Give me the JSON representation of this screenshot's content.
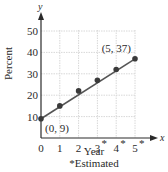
{
  "chart_data": {
    "type": "scatter",
    "title": "",
    "xlabel": "Year",
    "ylabel": "Percent",
    "x_axis_var": "x",
    "y_axis_var": "y",
    "footnote": "*Estimated",
    "x_ticks": [
      "0",
      "1",
      "2",
      "3*",
      "4*",
      "5*"
    ],
    "y_ticks": [
      "10",
      "20",
      "30",
      "40",
      "50"
    ],
    "xlim": [
      0,
      5
    ],
    "ylim": [
      0,
      50
    ],
    "grid": true,
    "points": [
      {
        "x": 0,
        "y": 9
      },
      {
        "x": 1,
        "y": 15
      },
      {
        "x": 2,
        "y": 22
      },
      {
        "x": 3,
        "y": 27
      },
      {
        "x": 4,
        "y": 32
      },
      {
        "x": 5,
        "y": 37
      }
    ],
    "trend_line": {
      "from": [
        0,
        9
      ],
      "to": [
        5,
        37
      ]
    },
    "annotations": [
      {
        "text": "(0, 9)",
        "x": 0,
        "y": 9
      },
      {
        "text": "(5, 37)",
        "x": 5,
        "y": 37
      }
    ],
    "colors": {
      "point": "#3a3a3a",
      "line": "#555555",
      "grid": "#d8d8d8",
      "axis": "#2a2a2a"
    }
  }
}
